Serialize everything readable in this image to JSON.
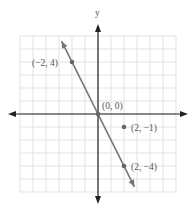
{
  "chart_data": {
    "type": "scatter",
    "title": "",
    "xlabel": "",
    "ylabel": "y",
    "xlim": [
      -6,
      6
    ],
    "ylim": [
      -6,
      6
    ],
    "grid": true,
    "line": {
      "slope": -2,
      "intercept": 0,
      "from": [
        -2.8,
        5.6
      ],
      "to": [
        2.8,
        -5.6
      ]
    },
    "points": [
      {
        "x": -2,
        "y": 4,
        "label": "(−2, 4)"
      },
      {
        "x": 0,
        "y": 0,
        "label": "(0, 0)"
      },
      {
        "x": 2,
        "y": -1,
        "label": "(2, −1)"
      },
      {
        "x": 2,
        "y": -4,
        "label": "(2, −4)"
      }
    ],
    "colors": {
      "grid": "#e3e3e3",
      "axis": "#222222",
      "line": "#777777",
      "point": "#666666"
    }
  }
}
